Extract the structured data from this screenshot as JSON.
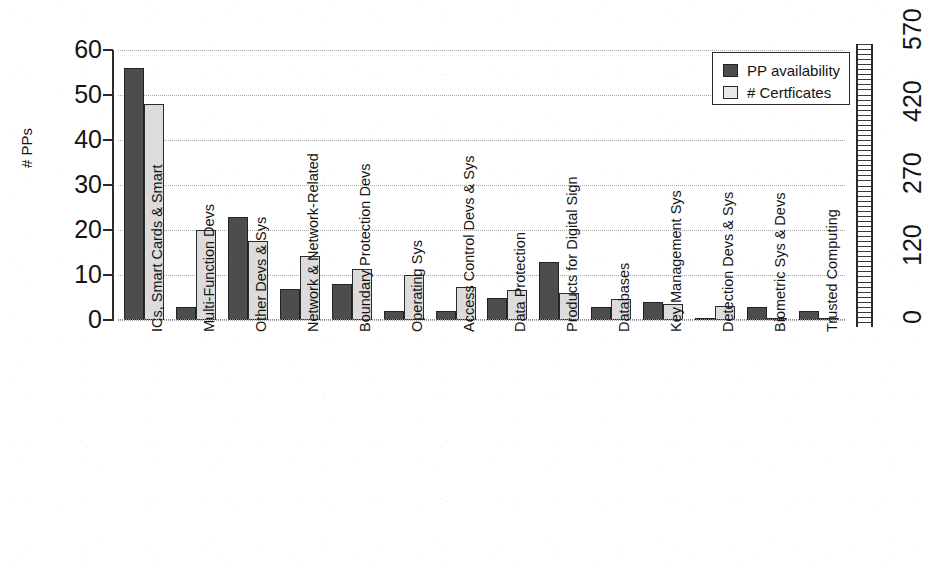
{
  "chart_data": {
    "type": "bar",
    "title": "",
    "subtitle": "",
    "xlabel": "",
    "ylabel": "# PPs",
    "y2label": "",
    "ylim": [
      0,
      60
    ],
    "y2lim": [
      0,
      570
    ],
    "grid": true,
    "legend_position": "top-right",
    "categories": [
      "ICs, Smart Cards & Smart",
      "Multi-Function Devs",
      "Other Devs & Sys",
      "Network & Network-Related",
      "Boundary Protection Devs",
      "Operating Sys",
      "Access Control Devs & Sys",
      "Data Protection",
      "Products for Digital Sign",
      "Databases",
      "Key Management Sys",
      "Detection Devs & Sys",
      "Biometric Sys & Devs",
      "Trusted Computing"
    ],
    "series": [
      {
        "name": "PP availability",
        "axis": "left",
        "color": "#4d4d4d",
        "values": [
          56,
          3,
          23,
          7,
          8,
          2,
          2,
          5,
          13,
          3,
          4,
          0.2,
          3,
          2
        ]
      },
      {
        "name": "# Certficates",
        "axis": "right",
        "color": "#dcdcdc",
        "values": [
          48,
          20,
          17.5,
          14.2,
          11.3,
          10,
          7.4,
          6.6,
          6,
          4.7,
          3.5,
          3.2,
          0.4,
          0.2
        ]
      }
    ],
    "yticks": [
      0,
      10,
      20,
      30,
      40,
      50,
      60
    ],
    "y2ticks": [
      0,
      120,
      270,
      420,
      570
    ]
  },
  "legend": {
    "items": [
      {
        "label": "PP availability",
        "swatch": "dark"
      },
      {
        "label": "# Certficates",
        "swatch": "light"
      }
    ]
  },
  "axes": {
    "left_title": "# PPs",
    "left_ticks": [
      "0",
      "10",
      "20",
      "30",
      "40",
      "50",
      "60"
    ],
    "right_ticks": [
      "0",
      "120",
      "270",
      "420",
      "570"
    ]
  }
}
